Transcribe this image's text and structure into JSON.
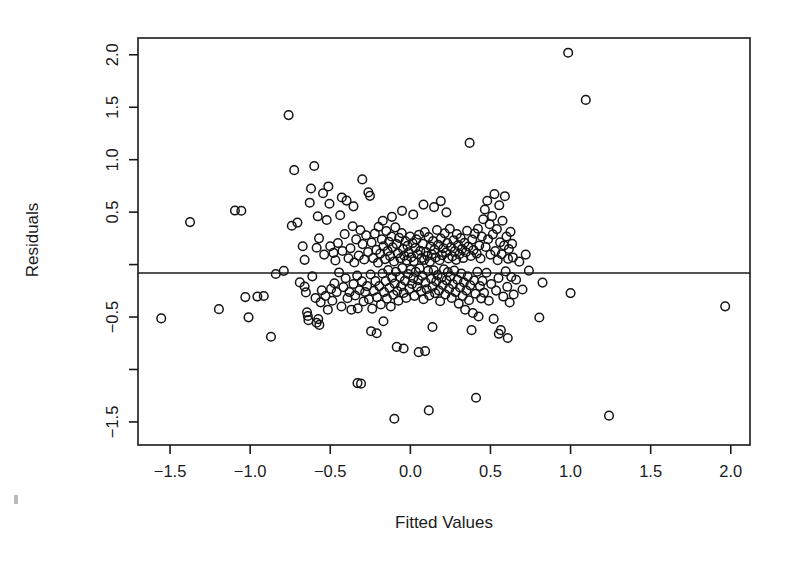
{
  "figure": {
    "kind": "scatter-plot",
    "background_color": "#ffffff",
    "foreground_color": "#1a1a1a",
    "marker": "open-circle"
  },
  "chart_data": {
    "type": "scatter",
    "title": "",
    "xlabel": "Fitted Values",
    "ylabel": "Residuals",
    "xlim": [
      -1.7,
      2.12
    ],
    "ylim": [
      -1.72,
      2.16
    ],
    "xticks": [
      -1.5,
      -1.0,
      -0.5,
      0.0,
      0.5,
      1.0,
      1.5,
      2.0
    ],
    "xticklabels": [
      "-1.5",
      "-1.0",
      "-0.5",
      "0.0",
      "0.5",
      "1.0",
      "1.5",
      "2.0"
    ],
    "yticks": [
      2.0,
      1.5,
      1.0,
      0.5,
      0.0,
      -0.5,
      -1.0,
      -1.5
    ],
    "yticklabels": [
      "2.0",
      "1.5",
      "1.0",
      "0.5",
      "",
      "-0.5",
      "",
      "-1.5"
    ],
    "grid": false,
    "legend": null,
    "annotations": [
      {
        "type": "hline",
        "y": 0.0,
        "label": "zero-residual-reference-line"
      }
    ],
    "marker_style": {
      "shape": "circle",
      "filled": false,
      "size": 4.3,
      "edge_color": "#141414"
    },
    "n_points": 312,
    "points": [
      [
        -1.555,
        -0.513
      ],
      [
        -1.375,
        0.405
      ],
      [
        -1.195,
        -0.425
      ],
      [
        -1.095,
        0.515
      ],
      [
        -1.055,
        0.513
      ],
      [
        -1.03,
        -0.31
      ],
      [
        -1.01,
        -0.503
      ],
      [
        -0.955,
        -0.305
      ],
      [
        -0.87,
        -0.688
      ],
      [
        -0.84,
        -0.09
      ],
      [
        -0.79,
        -0.06
      ],
      [
        -0.76,
        1.425
      ],
      [
        -0.74,
        0.37
      ],
      [
        -0.725,
        0.9
      ],
      [
        -0.705,
        0.4
      ],
      [
        -0.69,
        -0.17
      ],
      [
        -0.672,
        0.175
      ],
      [
        -0.66,
        -0.21
      ],
      [
        -0.652,
        -0.265
      ],
      [
        -0.645,
        -0.455
      ],
      [
        -0.64,
        -0.49
      ],
      [
        -0.636,
        -0.53
      ],
      [
        -0.628,
        0.59
      ],
      [
        -0.62,
        0.725
      ],
      [
        -0.612,
        -0.112
      ],
      [
        -0.6,
        0.94
      ],
      [
        -0.592,
        -0.318
      ],
      [
        -0.585,
        0.16
      ],
      [
        -0.578,
        0.46
      ],
      [
        -0.57,
        0.25
      ],
      [
        -0.56,
        -0.36
      ],
      [
        -0.553,
        -0.245
      ],
      [
        -0.545,
        0.68
      ],
      [
        -0.538,
        0.095
      ],
      [
        -0.53,
        -0.3
      ],
      [
        -0.522,
        0.425
      ],
      [
        -0.515,
        -0.43
      ],
      [
        -0.505,
        0.58
      ],
      [
        -0.5,
        0.175
      ],
      [
        -0.495,
        -0.232
      ],
      [
        -0.487,
        -0.345
      ],
      [
        -0.48,
        0.112
      ],
      [
        -0.474,
        -0.178
      ],
      [
        -0.468,
        0.04
      ],
      [
        -0.46,
        -0.262
      ],
      [
        -0.452,
        0.205
      ],
      [
        -0.445,
        -0.075
      ],
      [
        -0.438,
        0.47
      ],
      [
        -0.43,
        -0.4
      ],
      [
        -0.424,
        0.13
      ],
      [
        -0.418,
        -0.215
      ],
      [
        -0.41,
        0.29
      ],
      [
        -0.404,
        -0.13
      ],
      [
        -0.398,
        0.61
      ],
      [
        -0.392,
        -0.32
      ],
      [
        -0.386,
        0.06
      ],
      [
        -0.38,
        -0.262
      ],
      [
        -0.374,
        0.155
      ],
      [
        -0.368,
        -0.43
      ],
      [
        -0.36,
        0.365
      ],
      [
        -0.355,
        -0.185
      ],
      [
        -0.35,
        0.02
      ],
      [
        -0.344,
        -0.295
      ],
      [
        -0.338,
        0.24
      ],
      [
        -0.332,
        -0.105
      ],
      [
        -0.328,
        -0.418
      ],
      [
        -0.322,
        0.085
      ],
      [
        -0.318,
        -0.245
      ],
      [
        -0.312,
        0.33
      ],
      [
        -0.308,
        -1.135
      ],
      [
        -0.302,
        -0.16
      ],
      [
        -0.298,
        0.195
      ],
      [
        -0.292,
        -0.352
      ],
      [
        -0.288,
        0.048
      ],
      [
        -0.282,
        -0.262
      ],
      [
        -0.276,
        0.28
      ],
      [
        -0.27,
        -0.205
      ],
      [
        -0.264,
        0.12
      ],
      [
        -0.258,
        -0.33
      ],
      [
        -0.252,
        0.655
      ],
      [
        -0.248,
        -0.095
      ],
      [
        -0.242,
        0.21
      ],
      [
        -0.238,
        -0.42
      ],
      [
        -0.232,
        0.062
      ],
      [
        -0.228,
        -0.25
      ],
      [
        -0.222,
        0.295
      ],
      [
        -0.218,
        -0.158
      ],
      [
        -0.212,
        0.14
      ],
      [
        -0.208,
        -0.312
      ],
      [
        -0.202,
        0.018
      ],
      [
        -0.198,
        0.36
      ],
      [
        -0.194,
        -0.205
      ],
      [
        -0.188,
        0.105
      ],
      [
        -0.184,
        -0.38
      ],
      [
        -0.178,
        0.24
      ],
      [
        -0.174,
        -0.085
      ],
      [
        -0.168,
        0.175
      ],
      [
        -0.164,
        -0.262
      ],
      [
        -0.158,
        0.052
      ],
      [
        -0.154,
        -0.158
      ],
      [
        -0.15,
        0.32
      ],
      [
        -0.146,
        -0.325
      ],
      [
        -0.142,
        0.13
      ],
      [
        -0.138,
        -0.052
      ],
      [
        -0.134,
        0.218
      ],
      [
        -0.13,
        -0.222
      ],
      [
        -0.126,
        0.08
      ],
      [
        -0.122,
        -0.4
      ],
      [
        -0.118,
        0.268
      ],
      [
        -0.114,
        -0.125
      ],
      [
        -0.11,
        0.165
      ],
      [
        -0.106,
        -0.288
      ],
      [
        -0.102,
        0.03
      ],
      [
        -0.098,
        -0.182
      ],
      [
        -0.094,
        0.355
      ],
      [
        -0.09,
        -0.068
      ],
      [
        -0.086,
        0.195
      ],
      [
        -0.082,
        -0.252
      ],
      [
        -0.078,
        0.108
      ],
      [
        -0.074,
        -0.345
      ],
      [
        -0.07,
        0.255
      ],
      [
        -0.066,
        -0.118
      ],
      [
        -0.062,
        0.06
      ],
      [
        -0.058,
        -0.208
      ],
      [
        -0.054,
        0.3
      ],
      [
        -0.05,
        -0.032
      ],
      [
        -0.046,
        0.148
      ],
      [
        -0.042,
        -0.27
      ],
      [
        -0.038,
        0.085
      ],
      [
        -0.034,
        -0.152
      ],
      [
        -0.03,
        0.222
      ],
      [
        -0.026,
        -0.318
      ],
      [
        -0.022,
        0.04
      ],
      [
        -0.018,
        0.178
      ],
      [
        -0.014,
        -0.09
      ],
      [
        -0.01,
        0.118
      ],
      [
        -0.006,
        -0.232
      ],
      [
        -0.002,
        0.268
      ],
      [
        0.002,
        -0.048
      ],
      [
        0.006,
        0.07
      ],
      [
        0.01,
        -0.185
      ],
      [
        0.014,
        0.205
      ],
      [
        0.018,
        -0.128
      ],
      [
        0.022,
        0.032
      ],
      [
        0.026,
        -0.298
      ],
      [
        0.03,
        0.158
      ],
      [
        0.034,
        -0.07
      ],
      [
        0.038,
        0.24
      ],
      [
        0.042,
        -0.212
      ],
      [
        0.046,
        0.098
      ],
      [
        0.05,
        -0.148
      ],
      [
        0.054,
        0.285
      ],
      [
        0.058,
        -0.035
      ],
      [
        0.062,
        0.132
      ],
      [
        0.066,
        -0.255
      ],
      [
        0.07,
        0.062
      ],
      [
        0.074,
        -0.108
      ],
      [
        0.078,
        0.198
      ],
      [
        0.082,
        -0.33
      ],
      [
        0.086,
        0.045
      ],
      [
        0.09,
        0.31
      ],
      [
        0.094,
        -0.17
      ],
      [
        0.098,
        0.12
      ],
      [
        0.102,
        -0.235
      ],
      [
        0.106,
        0.082
      ],
      [
        0.11,
        -0.06
      ],
      [
        0.114,
        0.262
      ],
      [
        0.118,
        -0.295
      ],
      [
        0.122,
        0.028
      ],
      [
        0.126,
        0.172
      ],
      [
        0.13,
        -0.135
      ],
      [
        0.134,
        0.098
      ],
      [
        0.138,
        -0.21
      ],
      [
        0.142,
        0.225
      ],
      [
        0.146,
        -0.055
      ],
      [
        0.15,
        0.142
      ],
      [
        0.154,
        -0.272
      ],
      [
        0.158,
        0.068
      ],
      [
        0.162,
        -0.16
      ],
      [
        0.166,
        0.33
      ],
      [
        0.17,
        -0.1
      ],
      [
        0.174,
        0.188
      ],
      [
        0.178,
        -0.248
      ],
      [
        0.182,
        0.042
      ],
      [
        0.186,
        -0.35
      ],
      [
        0.19,
        0.248
      ],
      [
        0.194,
        -0.125
      ],
      [
        0.198,
        0.09
      ],
      [
        0.202,
        -0.195
      ],
      [
        0.206,
        0.155
      ],
      [
        0.21,
        -0.045
      ],
      [
        0.214,
        0.298
      ],
      [
        0.218,
        -0.285
      ],
      [
        0.222,
        0.115
      ],
      [
        0.226,
        -0.15
      ],
      [
        0.23,
        0.205
      ],
      [
        0.234,
        -0.072
      ],
      [
        0.238,
        0.058
      ],
      [
        0.242,
        -0.232
      ],
      [
        0.246,
        0.342
      ],
      [
        0.25,
        -0.112
      ],
      [
        0.254,
        0.168
      ],
      [
        0.258,
        -0.318
      ],
      [
        0.262,
        0.078
      ],
      [
        0.266,
        -0.188
      ],
      [
        0.27,
        0.232
      ],
      [
        0.274,
        -0.058
      ],
      [
        0.278,
        0.128
      ],
      [
        0.282,
        -0.262
      ],
      [
        0.286,
        0.045
      ],
      [
        0.29,
        0.29
      ],
      [
        0.294,
        -0.145
      ],
      [
        0.298,
        0.185
      ],
      [
        0.302,
        -0.372
      ],
      [
        0.306,
        0.098
      ],
      [
        0.31,
        -0.218
      ],
      [
        0.314,
        0.252
      ],
      [
        0.318,
        -0.085
      ],
      [
        0.322,
        0.148
      ],
      [
        0.326,
        -0.298
      ],
      [
        0.33,
        0.062
      ],
      [
        0.334,
        -0.168
      ],
      [
        0.338,
        0.208
      ],
      [
        0.342,
        -0.43
      ],
      [
        0.346,
        0.118
      ],
      [
        0.35,
        -0.248
      ],
      [
        0.354,
        0.322
      ],
      [
        0.358,
        -0.112
      ],
      [
        0.362,
        0.172
      ],
      [
        0.366,
        -0.34
      ],
      [
        0.37,
        1.16
      ],
      [
        0.374,
        -0.198
      ],
      [
        0.378,
        0.082
      ],
      [
        0.382,
        -0.625
      ],
      [
        0.386,
        0.238
      ],
      [
        0.39,
        -0.462
      ],
      [
        0.394,
        0.138
      ],
      [
        0.398,
        -0.152
      ],
      [
        0.402,
        0.295
      ],
      [
        0.406,
        -0.278
      ],
      [
        0.41,
        -1.27
      ],
      [
        0.414,
        0.105
      ],
      [
        0.418,
        -0.068
      ],
      [
        0.422,
        0.342
      ],
      [
        0.426,
        -0.495
      ],
      [
        0.43,
        0.182
      ],
      [
        0.434,
        -0.205
      ],
      [
        0.438,
        0.058
      ],
      [
        0.442,
        -0.322
      ],
      [
        0.446,
        0.268
      ],
      [
        0.45,
        -0.155
      ],
      [
        0.455,
        0.432
      ],
      [
        0.46,
        -0.268
      ],
      [
        0.465,
        0.525
      ],
      [
        0.47,
        0.168
      ],
      [
        0.475,
        -0.078
      ],
      [
        0.48,
        0.608
      ],
      [
        0.485,
        0.242
      ],
      [
        0.49,
        -0.345
      ],
      [
        0.495,
        0.385
      ],
      [
        0.5,
        0.095
      ],
      [
        0.505,
        -0.185
      ],
      [
        0.51,
        0.462
      ],
      [
        0.515,
        0.288
      ],
      [
        0.52,
        -0.518
      ],
      [
        0.525,
        0.672
      ],
      [
        0.53,
        0.128
      ],
      [
        0.535,
        -0.248
      ],
      [
        0.54,
        0.338
      ],
      [
        0.545,
        0.042
      ],
      [
        0.55,
        -0.128
      ],
      [
        0.555,
        0.565
      ],
      [
        0.56,
        0.212
      ],
      [
        0.565,
        -0.625
      ],
      [
        0.57,
        0.098
      ],
      [
        0.575,
        0.418
      ],
      [
        0.58,
        -0.305
      ],
      [
        0.585,
        0.182
      ],
      [
        0.59,
        0.652
      ],
      [
        0.595,
        -0.065
      ],
      [
        0.6,
        0.268
      ],
      [
        0.605,
        -0.212
      ],
      [
        0.61,
        0.055
      ],
      [
        0.615,
        0.148
      ],
      [
        0.62,
        -0.362
      ],
      [
        0.625,
        0.312
      ],
      [
        0.63,
        -0.118
      ],
      [
        0.635,
        0.198
      ],
      [
        0.64,
        0.068
      ],
      [
        0.645,
        -0.285
      ],
      [
        0.66,
        -0.145
      ],
      [
        0.68,
        0.028
      ],
      [
        0.7,
        -0.238
      ],
      [
        0.72,
        0.095
      ],
      [
        0.74,
        -0.058
      ],
      [
        0.805,
        -0.505
      ],
      [
        0.825,
        -0.172
      ],
      [
        0.985,
        2.02
      ],
      [
        1.0,
        -0.272
      ],
      [
        1.095,
        1.57
      ],
      [
        1.24,
        -1.44
      ],
      [
        1.965,
        -0.398
      ],
      [
        -0.1,
        -1.47
      ],
      [
        0.115,
        -1.39
      ],
      [
        -0.33,
        -1.13
      ],
      [
        0.052,
        -0.835
      ],
      [
        0.092,
        -0.825
      ],
      [
        -0.085,
        -0.785
      ],
      [
        -0.042,
        -0.8
      ],
      [
        -0.21,
        -0.655
      ],
      [
        -0.245,
        -0.635
      ],
      [
        -0.168,
        -0.54
      ],
      [
        0.138,
        -0.595
      ],
      [
        0.552,
        -0.66
      ],
      [
        0.608,
        -0.7
      ],
      [
        -0.585,
        -0.555
      ],
      [
        -0.575,
        -0.52
      ],
      [
        -0.568,
        -0.575
      ],
      [
        -0.66,
        0.045
      ],
      [
        -0.915,
        -0.3
      ],
      [
        -0.512,
        0.745
      ],
      [
        -0.428,
        0.64
      ],
      [
        -0.355,
        0.555
      ],
      [
        -0.3,
        0.812
      ],
      [
        -0.262,
        0.688
      ],
      [
        0.19,
        0.605
      ],
      [
        0.225,
        0.498
      ],
      [
        0.148,
        0.548
      ],
      [
        0.082,
        0.572
      ],
      [
        0.018,
        0.478
      ],
      [
        -0.052,
        0.512
      ],
      [
        -0.115,
        0.455
      ],
      [
        -0.172,
        0.418
      ]
    ]
  }
}
